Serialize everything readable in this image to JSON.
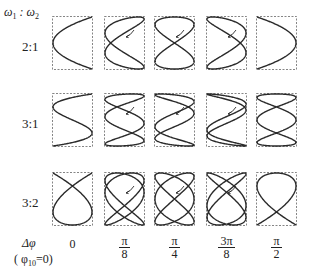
{
  "header": {
    "w1": "ω",
    "w1_sub": "1",
    "sep": " : ",
    "w2": "ω",
    "w2_sub": "2"
  },
  "rows": [
    {
      "label": "2:1",
      "fx": 2,
      "fy": 1,
      "top": 16,
      "label_top": 39
    },
    {
      "label": "3:1",
      "fx": 3,
      "fy": 1,
      "top": 93,
      "label_top": 116
    },
    {
      "label": "3:2",
      "fx": 3,
      "fy": 2,
      "top": 172,
      "label_top": 195
    }
  ],
  "columns": [
    {
      "phase": 0,
      "left": 52,
      "label": {
        "type": "plain",
        "text": "0"
      },
      "arrow": false
    },
    {
      "phase": 0.392699,
      "left": 104,
      "label": {
        "type": "frac",
        "num": "π",
        "den": "8"
      },
      "arrow": true
    },
    {
      "phase": 0.785398,
      "left": 154,
      "label": {
        "type": "frac",
        "num": "π",
        "den": "4"
      },
      "arrow": true
    },
    {
      "phase": 1.178097,
      "left": 206,
      "label": {
        "type": "frac",
        "num": "3π",
        "den": "8"
      },
      "arrow": true
    },
    {
      "phase": 1.570796,
      "left": 256,
      "label": {
        "type": "frac",
        "num": "π",
        "den": "2"
      },
      "arrow": false
    }
  ],
  "footer": {
    "delta_phi": "Δφ",
    "phi0_open": "( φ",
    "phi0_sub": "10",
    "phi0_close": "=0)"
  },
  "colors": {
    "curve": "#2a2a2a",
    "frame": "#666666"
  }
}
